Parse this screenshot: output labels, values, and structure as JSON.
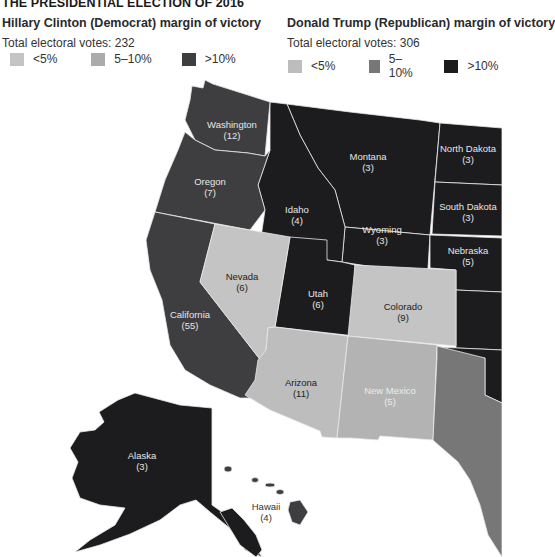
{
  "title": "THE PRESIDENTIAL ELECTION OF 2016",
  "legend": {
    "clinton": {
      "heading": "Hillary Clinton (Democrat) margin of victory",
      "total": "Total electoral votes: 232",
      "items": [
        {
          "label": "<5%",
          "color": "#c4c4c4"
        },
        {
          "label": "5–10%",
          "color": "#ababab"
        },
        {
          "label": ">10%",
          "color": "#3e3e40"
        }
      ]
    },
    "trump": {
      "heading": "Donald Trump (Republican) margin of victory",
      "total": "Total electoral votes: 306",
      "items": [
        {
          "label": "<5%",
          "color": "#bdbdbd"
        },
        {
          "label": "5–10%",
          "color": "#777777"
        },
        {
          "label": ">10%",
          "color": "#1c1c1e"
        }
      ]
    }
  },
  "states": {
    "washington": {
      "name": "Washington",
      "votes": "(12)",
      "winner": "Clinton",
      "margin": ">10%"
    },
    "oregon": {
      "name": "Oregon",
      "votes": "(7)",
      "winner": "Clinton",
      "margin": ">10%"
    },
    "california": {
      "name": "California",
      "votes": "(55)",
      "winner": "Clinton",
      "margin": ">10%"
    },
    "nevada": {
      "name": "Nevada",
      "votes": "(6)",
      "winner": "Clinton",
      "margin": "<5%"
    },
    "idaho": {
      "name": "Idaho",
      "votes": "(4)",
      "winner": "Trump",
      "margin": ">10%"
    },
    "montana": {
      "name": "Montana",
      "votes": "(3)",
      "winner": "Trump",
      "margin": ">10%"
    },
    "wyoming": {
      "name": "Wyoming",
      "votes": "(3)",
      "winner": "Trump",
      "margin": ">10%"
    },
    "utah": {
      "name": "Utah",
      "votes": "(6)",
      "winner": "Trump",
      "margin": ">10%"
    },
    "colorado": {
      "name": "Colorado",
      "votes": "(9)",
      "winner": "Clinton",
      "margin": "<5%"
    },
    "arizona": {
      "name": "Arizona",
      "votes": "(11)",
      "winner": "Trump",
      "margin": "<5%"
    },
    "new_mexico": {
      "name": "New Mexico",
      "votes": "(5)",
      "winner": "Clinton",
      "margin": "5–10%"
    },
    "north_dakota": {
      "name": "North Dakota",
      "votes": "(3)",
      "winner": "Trump",
      "margin": ">10%"
    },
    "south_dakota": {
      "name": "South Dakota",
      "votes": "(3)",
      "winner": "Trump",
      "margin": ">10%"
    },
    "nebraska": {
      "name": "Nebraska",
      "votes": "(5)",
      "winner": "Trump",
      "margin": ">10%"
    },
    "alaska": {
      "name": "Alaska",
      "votes": "(3)",
      "winner": "Trump",
      "margin": ">10%"
    },
    "hawaii": {
      "name": "Hawaii",
      "votes": "(4)",
      "winner": "Clinton",
      "margin": ">10%"
    },
    "texas": {
      "name": "",
      "votes": "",
      "winner": "Trump",
      "margin": "5–10%"
    }
  },
  "colors": {
    "clinton_strong": "#3e3e40",
    "trump_strong": "#1c1c1e",
    "lean_light": "#c4c4c4",
    "nm": "#b3b3b3",
    "trump_mid": "#777777",
    "border": "#e6e6e6"
  }
}
